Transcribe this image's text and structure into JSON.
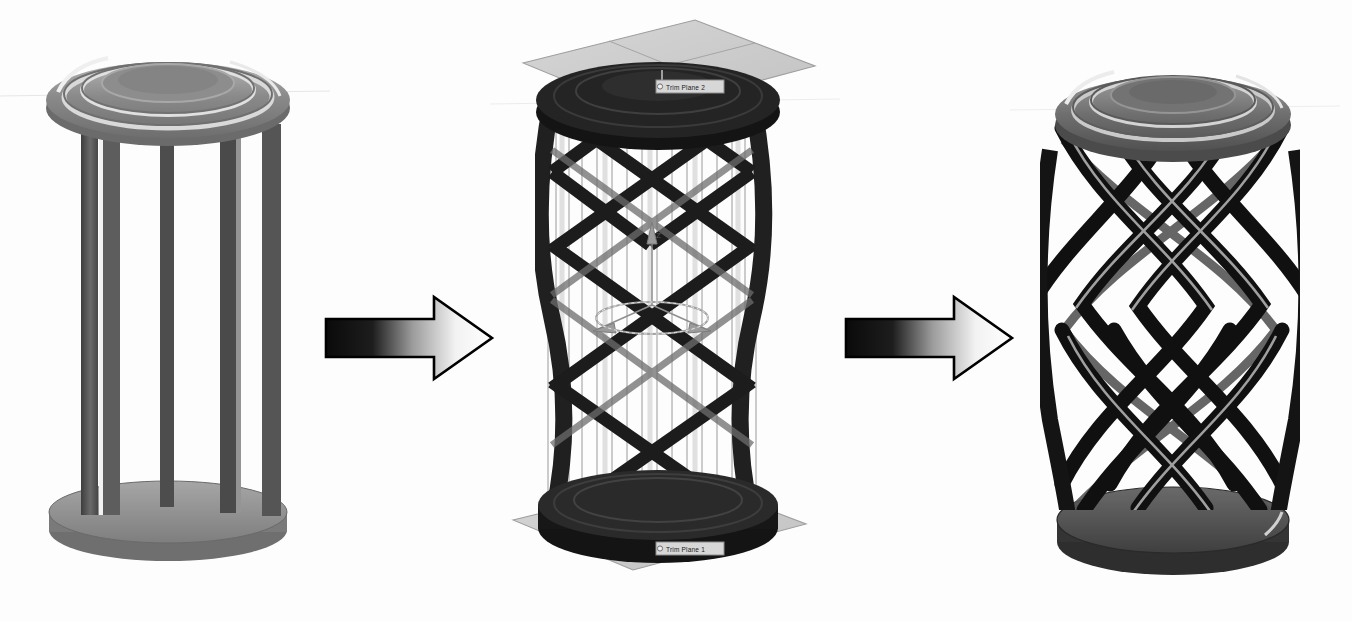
{
  "figure": {
    "background_color": "#ffffff",
    "ink_color": "#1a1a1a",
    "stage_count": 3,
    "arrow_count": 2
  },
  "stages": [
    {
      "id": "stage-1",
      "name": "straight-post-column",
      "caption": "",
      "top_disc": {
        "name": "top-cap-disc",
        "rings": 4,
        "fill": "#8f8f8f"
      },
      "base_disc": {
        "name": "base-disc",
        "fill": "#9a9a9a"
      },
      "posts": {
        "name": "vertical-posts",
        "count": 6,
        "fill": "#4a4a4a"
      },
      "has_lattice": false,
      "has_planes": false,
      "has_triad": false
    },
    {
      "id": "stage-2",
      "name": "wireframe-lattice-with-trim-planes",
      "caption": "",
      "top_disc": {
        "name": "top-cap-disc",
        "rings": 3,
        "fill": "#2b2b2b"
      },
      "base_disc": {
        "name": "base-disc",
        "fill": "#2b2b2b"
      },
      "posts": {
        "name": "wireframe-guide-lines",
        "count": 14,
        "fill": "#777777"
      },
      "has_lattice": true,
      "lattice_crossings": 5,
      "has_planes": true,
      "has_triad": true,
      "plane_labels": [
        {
          "name": "trim-plane-2-label",
          "text": "Trim Plane 2"
        },
        {
          "name": "trim-plane-1-label",
          "text": "Trim Plane 1"
        }
      ],
      "triad": {
        "name": "origin-triad",
        "axis_label": "Z"
      }
    },
    {
      "id": "stage-3",
      "name": "twisted-helical-column",
      "caption": "",
      "top_disc": {
        "name": "top-cap-disc",
        "rings": 4,
        "fill": "#6e6e6e"
      },
      "base_disc": {
        "name": "base-disc",
        "fill": "#5a5a5a"
      },
      "posts": {
        "name": "helical-ribs",
        "count": 10,
        "fill": "#1f1f1f"
      },
      "has_lattice": true,
      "lattice_crossings": 6,
      "has_planes": false,
      "has_triad": false
    }
  ],
  "arrows": [
    {
      "id": "arrow-1",
      "name": "transition-arrow-1",
      "direction": "right",
      "gradient_from": "#0a0a0a",
      "gradient_to": "#ffffff",
      "outline_color": "#000000"
    },
    {
      "id": "arrow-2",
      "name": "transition-arrow-2",
      "direction": "right",
      "gradient_from": "#0a0a0a",
      "gradient_to": "#ffffff",
      "outline_color": "#000000"
    }
  ]
}
